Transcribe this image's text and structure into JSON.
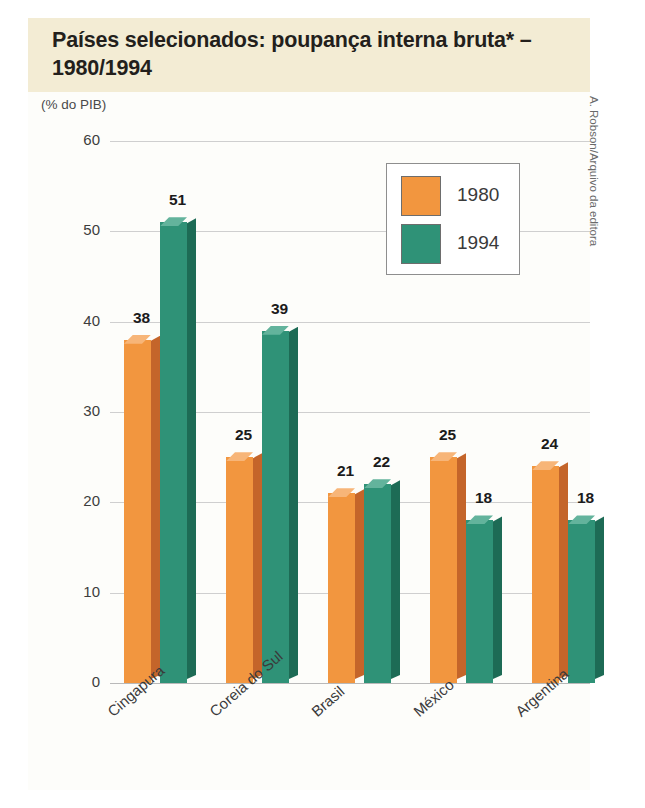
{
  "figure": {
    "title": "Países selecionados: poupança interna bruta* – 1980/1994",
    "unit_label": "(% do PIB)",
    "credit": "A. Robson/Arquivo da editora"
  },
  "colors": {
    "series_1980": "#F2963F",
    "series_1980_side": "#C4652A",
    "series_1980_top": "#F7B578",
    "series_1994": "#2F9277",
    "series_1994_side": "#1D6B55",
    "series_1994_top": "#63B39C",
    "title_band": "#F3ECD4",
    "panel": "#FDFDFA",
    "gridline": "#CFCFCF",
    "text": "#231F1C"
  },
  "chart_data": {
    "type": "bar",
    "title": "Países selecionados: poupança interna bruta* – 1980/1994",
    "subtitle": "",
    "xlabel": "",
    "ylabel": "(% do PIB)",
    "ylim": [
      0,
      60
    ],
    "yticks": [
      0,
      10,
      20,
      30,
      40,
      50,
      60
    ],
    "ytick_labels": [
      "0",
      "10",
      "20",
      "30",
      "40",
      "50",
      "60"
    ],
    "grid": true,
    "grid_axis": "y",
    "legend_position": "upper-right",
    "categories": [
      "Cingapura",
      "Coreia do Sul",
      "Brasil",
      "México",
      "Argentina"
    ],
    "series": [
      {
        "name": "1980",
        "color": "#F2963F",
        "values": [
          38,
          25,
          21,
          25,
          24
        ]
      },
      {
        "name": "1994",
        "color": "#2F9277",
        "values": [
          51,
          39,
          22,
          18,
          18
        ]
      }
    ],
    "annotations": [
      "* poupança interna bruta"
    ]
  }
}
